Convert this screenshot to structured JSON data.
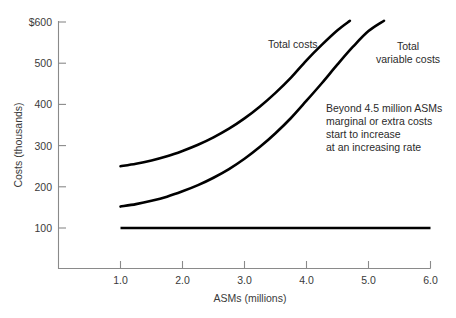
{
  "chart_data": {
    "type": "line",
    "title": "",
    "xlabel": "ASMs (millions)",
    "ylabel": "Costs (thousands)",
    "xlim": [
      0.5,
      6.0
    ],
    "ylim": [
      0,
      600
    ],
    "grid": false,
    "legend_position": "inline-annotations",
    "xticks": [
      "1.0",
      "2.0",
      "3.0",
      "4.0",
      "5.0",
      "6.0"
    ],
    "xtick_values": [
      1.0,
      2.0,
      3.0,
      4.0,
      5.0,
      6.0
    ],
    "yticks": [
      "100",
      "200",
      "300",
      "400",
      "500",
      "$600"
    ],
    "ytick_values": [
      100,
      200,
      300,
      400,
      500,
      600
    ],
    "series": [
      {
        "name": "Total costs",
        "x": [
          1.0,
          1.25,
          1.5,
          1.75,
          2.0,
          2.25,
          2.5,
          2.75,
          3.0,
          3.25,
          3.5,
          3.75,
          4.0,
          4.25,
          4.5,
          4.7
        ],
        "values": [
          250,
          256,
          264,
          274,
          287,
          302,
          320,
          341,
          366,
          395,
          428,
          465,
          507,
          545,
          580,
          603
        ]
      },
      {
        "name": "Total variable costs",
        "x": [
          1.0,
          1.25,
          1.5,
          1.75,
          2.0,
          2.25,
          2.5,
          2.75,
          3.0,
          3.25,
          3.5,
          3.75,
          4.0,
          4.25,
          4.5,
          4.75,
          5.0,
          5.25
        ],
        "values": [
          152,
          158,
          166,
          176,
          189,
          204,
          222,
          243,
          268,
          297,
          330,
          367,
          409,
          452,
          497,
          540,
          578,
          603
        ]
      },
      {
        "name": "Total fixed costs",
        "x": [
          1.0,
          6.0
        ],
        "values": [
          100,
          100
        ]
      }
    ],
    "annotations": [
      {
        "name": "total-costs-label",
        "text": "Total costs",
        "x": 2.58,
        "y": 508
      },
      {
        "name": "total-variable-costs-label",
        "lines": [
          "Total",
          "variable costs"
        ],
        "x": 5.05,
        "y": 505
      },
      {
        "name": "marginal-cost-note",
        "lines": [
          "Beyond 4.5 million ASMs",
          "marginal or extra costs",
          "start to increase",
          "at an increasing rate"
        ],
        "x": 3.35,
        "y": 412
      }
    ],
    "colors": {
      "curve": "#000000",
      "axis": "#8a8a8a",
      "text": "#2b2b2b",
      "background": "#ffffff"
    }
  }
}
